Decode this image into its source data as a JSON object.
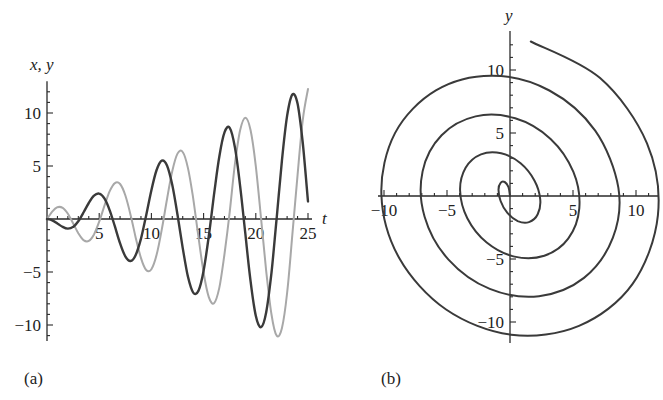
{
  "chart_data": [
    {
      "type": "line",
      "panel_label": "(a)",
      "xlabel": "t",
      "ylabel": "x, y",
      "xlim": [
        0,
        25
      ],
      "ylim": [
        -11.5,
        13
      ],
      "xticks": [
        5,
        10,
        15,
        20,
        25
      ],
      "yticks": [
        -10,
        -5,
        5,
        10
      ],
      "xtick_labels": [
        "5",
        "10",
        "15",
        "20",
        "25"
      ],
      "ytick_labels": [
        "−10",
        "−5",
        "5",
        "10"
      ],
      "grid": false,
      "legend": null,
      "x": [
        0,
        0.5,
        1,
        1.5,
        2,
        2.5,
        3,
        3.5,
        4,
        4.5,
        5,
        5.5,
        6,
        6.5,
        7,
        7.5,
        8,
        8.5,
        9,
        9.5,
        10,
        10.5,
        11,
        11.5,
        12,
        12.5,
        13,
        13.5,
        14,
        14.5,
        15,
        15.5,
        16,
        16.5,
        17,
        17.5,
        18,
        18.5,
        19,
        19.5,
        20,
        20.5,
        21,
        21.5,
        22,
        22.5,
        23,
        23.5,
        24,
        24.5,
        25
      ],
      "series": [
        {
          "name": "x",
          "color": "#3a3a3a",
          "values": [
            0,
            -0.12,
            -0.42,
            -0.75,
            -0.91,
            -0.75,
            -0.21,
            0.61,
            1.51,
            2.2,
            2.4,
            1.94,
            0.84,
            -0.7,
            -2.3,
            -3.52,
            -3.96,
            -3.39,
            -1.85,
            0.36,
            2.72,
            4.62,
            5.5,
            5.03,
            3.22,
            0.41,
            -2.73,
            -5.43,
            -6.94,
            -6.78,
            -4.88,
            -1.6,
            2.3,
            5.87,
            8.17,
            8.6,
            6.76,
            3.13,
            -1.43,
            -5.88,
            -9.13,
            -10.21,
            -8.79,
            -5.07,
            0.1,
            5.48,
            9.73,
            11.74,
            10.87,
            7.15,
            1.65
          ]
        },
        {
          "name": "y",
          "color": "#a8a8a8",
          "values": [
            0,
            0.7,
            1.11,
            1.05,
            0.49,
            -0.4,
            -1.34,
            -1.99,
            -2.07,
            -1.45,
            -0.25,
            1.24,
            2.6,
            3.39,
            3.3,
            2.24,
            0.41,
            -1.76,
            -3.69,
            -4.81,
            -4.74,
            -3.38,
            -0.98,
            1.91,
            4.53,
            6.17,
            6.32,
            4.82,
            1.95,
            -1.64,
            -5.05,
            -7.37,
            -7.95,
            -6.5,
            -3.3,
            0.64,
            5.19,
            8.37,
            9.55,
            8.38,
            4.99,
            0.1,
            -4.92,
            -9.01,
            -11.01,
            -10.31,
            -6.98,
            -1.53,
            4.18,
            9.36,
            12.26
          ]
        }
      ]
    },
    {
      "type": "line",
      "subtype": "parametric",
      "panel_label": "(b)",
      "xlabel": "",
      "ylabel": "y",
      "xlim": [
        -10.5,
        11.8
      ],
      "ylim": [
        -11.6,
        13
      ],
      "xticks": [
        -10,
        -5,
        5,
        10
      ],
      "yticks": [
        -10,
        -5,
        5,
        10
      ],
      "xtick_labels": [
        "−10",
        "−5",
        "5",
        "10"
      ],
      "ytick_labels": [
        "−10",
        "−5",
        "5",
        "10"
      ],
      "grid": false,
      "legend": null,
      "series": [
        {
          "name": "(x, y) trajectory",
          "color": "#3a3a3a",
          "source": "parametric curve of x(t), y(t) from panel (a), t from 0 to 25"
        }
      ]
    }
  ]
}
